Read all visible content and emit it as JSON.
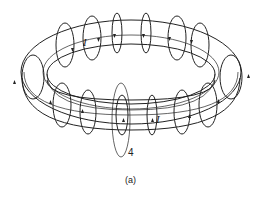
{
  "figure": {
    "labels": {
      "current_top": "I",
      "current_bottom": "I",
      "loop_number": "4",
      "caption": "(a)"
    },
    "colors": {
      "line": "#222222",
      "background": "#ffffff"
    }
  }
}
